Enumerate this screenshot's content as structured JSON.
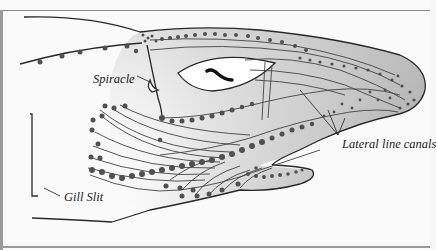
{
  "diagram": {
    "labels": {
      "spiracle": "Spiracle",
      "lateral_line_canals": "Lateral line canals",
      "gill_slit": "Gill Slit"
    },
    "colors": {
      "background": "#fafafa",
      "outline": "#2a2a2a",
      "head_fill_light": "#e6e6e6",
      "head_fill_dark": "#9a9a9a",
      "canal_dots": "#555555",
      "eye": "#ffffff",
      "pupil": "#111111"
    }
  }
}
